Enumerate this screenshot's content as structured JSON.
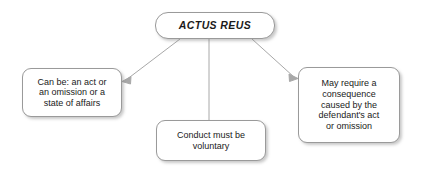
{
  "diagram": {
    "title": "ACTUS REUS",
    "background_color": "#ffffff",
    "node_fill_color": "#ffffff",
    "node_border_color": "#9a9a9a",
    "edge_color": "#a8a8a8",
    "text_color": "#1a1a1a",
    "nodes": [
      {
        "id": "root",
        "label": "ACTUS REUS",
        "role": "root",
        "style": "bold-italic"
      },
      {
        "id": "left",
        "label": "Can be: an act or\nan omission or a\nstate of affairs",
        "role": "branch"
      },
      {
        "id": "middle",
        "label": "Conduct must be\nvoluntary",
        "role": "branch"
      },
      {
        "id": "right",
        "label": "May require a\nconsequence\ncaused by the\ndefendant's act\nor omission",
        "role": "branch"
      }
    ],
    "edges": [
      {
        "id": "root-to-left",
        "from": "root",
        "to": "left",
        "arrowhead": "left"
      },
      {
        "id": "root-to-middle",
        "from": "root",
        "to": "middle",
        "arrowhead": "none"
      },
      {
        "id": "root-to-right",
        "from": "root",
        "to": "right",
        "arrowhead": "right"
      }
    ]
  }
}
